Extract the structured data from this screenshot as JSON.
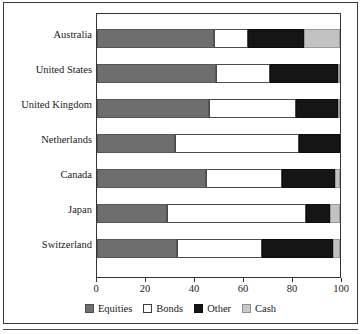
{
  "chart_data": {
    "type": "bar",
    "orientation": "horizontal",
    "stacked": true,
    "title": "",
    "subtitle": "",
    "xlabel": "",
    "ylabel": "",
    "xlim": [
      0,
      100
    ],
    "xticks": [
      0,
      20,
      40,
      60,
      80,
      100
    ],
    "xtick_labels": [
      "0",
      "20",
      "40",
      "60",
      "80",
      "100"
    ],
    "grid": false,
    "legend_position": "bottom",
    "categories": [
      "Australia",
      "United States",
      "United Kingdom",
      "Netherlands",
      "Canada",
      "Japan",
      "Switzerland"
    ],
    "series": [
      {
        "name": "Equities",
        "color": "#6e6e6e",
        "values": [
          48,
          49,
          46,
          32,
          45,
          29,
          33
        ]
      },
      {
        "name": "Bonds",
        "color": "#ffffff",
        "values": [
          14,
          22,
          36,
          51,
          31,
          57,
          35
        ]
      },
      {
        "name": "Other",
        "color": "#151515",
        "values": [
          23,
          28,
          17,
          17,
          22,
          10,
          29
        ]
      },
      {
        "name": "Cash",
        "color": "#c2c2c2",
        "values": [
          15,
          1,
          1,
          0,
          2,
          4,
          3
        ]
      }
    ],
    "legend": [
      "Equities",
      "Bonds",
      "Other",
      "Cash"
    ]
  },
  "legend": {
    "items": [
      {
        "label": "Equities",
        "swatch": "equities"
      },
      {
        "label": "Bonds",
        "swatch": "bonds"
      },
      {
        "label": "Other",
        "swatch": "other"
      },
      {
        "label": "Cash",
        "swatch": "cash"
      }
    ]
  }
}
